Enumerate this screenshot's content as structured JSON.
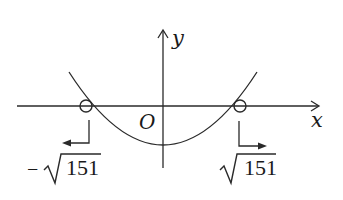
{
  "figure": {
    "type": "coordinate-plane-sketch",
    "axes": {
      "x_label": "x",
      "y_label": "y",
      "origin_label": "O"
    },
    "curve": {
      "kind": "parabola",
      "opens": "up",
      "vertex_below_origin": true
    },
    "roots": [
      {
        "label": "−√151",
        "minus": "−",
        "radicand": "151",
        "marker": "open-circle",
        "arrow_direction": "left"
      },
      {
        "label": "√151",
        "minus": "",
        "radicand": "151",
        "marker": "open-circle",
        "arrow_direction": "right"
      }
    ],
    "colors": {
      "stroke": "#2a2a2a",
      "background": "#ffffff"
    }
  }
}
